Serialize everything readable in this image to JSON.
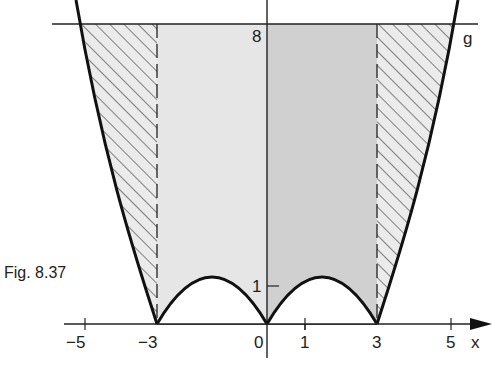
{
  "figure": {
    "caption": "Fig. 8.37",
    "line_label": "g",
    "axis_label_x": "x",
    "y_ticks": [
      {
        "value": 8,
        "label": "8"
      },
      {
        "value": 1,
        "label": "1"
      }
    ],
    "x_ticks": [
      {
        "value": -5,
        "label": "−5"
      },
      {
        "value": -3,
        "label": "−3"
      },
      {
        "value": 0,
        "label": "0"
      },
      {
        "value": 1,
        "label": "1"
      },
      {
        "value": 3,
        "label": "3"
      },
      {
        "value": 5,
        "label": "5"
      }
    ],
    "colors": {
      "light_fill": "#e6e6e6",
      "dark_fill": "#cfcfcf",
      "stroke": "#111111",
      "hatch": "#444444"
    }
  }
}
